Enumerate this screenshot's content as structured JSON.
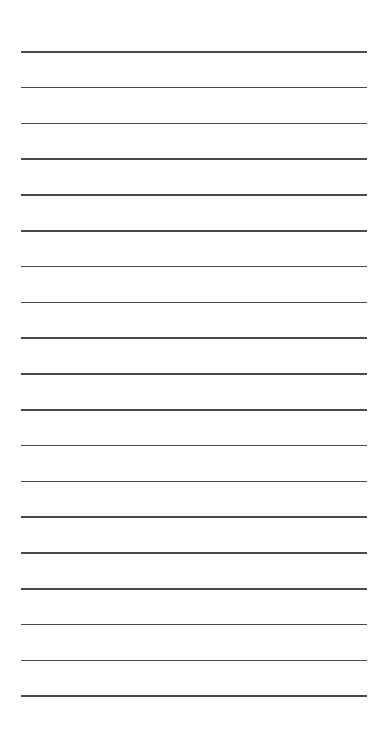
{
  "paper": {
    "type": "lined",
    "line_count": 19,
    "first_line_y": 51,
    "line_spacing": 35.8,
    "line_left": 21,
    "line_right": 367,
    "line_color": "#4a4a4a",
    "background_color": "#ffffff"
  }
}
